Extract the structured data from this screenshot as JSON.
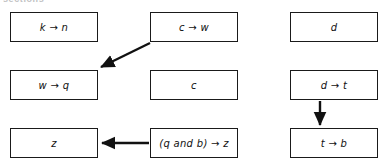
{
  "header": {
    "clipped_text": "sections"
  },
  "diagram": {
    "type": "flowchart",
    "background_color": "#ffffff",
    "box_border_color": "#1a1a1a",
    "arrow_color": "#111111",
    "text_color": "#111111",
    "nodes": [
      {
        "id": "k-n",
        "label": "k → n",
        "row": 1,
        "col": 1,
        "x": 10,
        "y": 12,
        "w": 88,
        "h": 30
      },
      {
        "id": "c-w",
        "label": "c → w",
        "row": 1,
        "col": 2,
        "x": 150,
        "y": 12,
        "w": 88,
        "h": 30
      },
      {
        "id": "d",
        "label": "d",
        "row": 1,
        "col": 3,
        "x": 290,
        "y": 12,
        "w": 88,
        "h": 30
      },
      {
        "id": "w-q",
        "label": "w → q",
        "row": 2,
        "col": 1,
        "x": 10,
        "y": 70,
        "w": 88,
        "h": 30
      },
      {
        "id": "c",
        "label": "c",
        "row": 2,
        "col": 2,
        "x": 150,
        "y": 70,
        "w": 88,
        "h": 30
      },
      {
        "id": "d-t",
        "label": "d → t",
        "row": 2,
        "col": 3,
        "x": 290,
        "y": 70,
        "w": 88,
        "h": 30
      },
      {
        "id": "z",
        "label": "z",
        "row": 3,
        "col": 1,
        "x": 10,
        "y": 128,
        "w": 88,
        "h": 30
      },
      {
        "id": "qb-z",
        "label": "(q and b) → z",
        "row": 3,
        "col": 2,
        "x": 150,
        "y": 128,
        "w": 88,
        "h": 30
      },
      {
        "id": "t-b",
        "label": "t → b",
        "row": 3,
        "col": 3,
        "x": 290,
        "y": 128,
        "w": 88,
        "h": 30
      }
    ],
    "edges": [
      {
        "id": "edge-cw-to-wq",
        "from": "c-w",
        "to": "w-q",
        "direction": "diagonal-down-left"
      },
      {
        "id": "edge-qbz-to-z",
        "from": "qb-z",
        "to": "z",
        "direction": "left"
      },
      {
        "id": "edge-dt-to-tb",
        "from": "d-t",
        "to": "t-b",
        "direction": "down"
      }
    ]
  }
}
